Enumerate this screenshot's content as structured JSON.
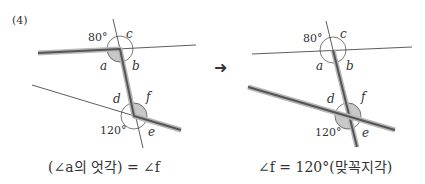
{
  "problem_number": "(4)",
  "arrow": "➜",
  "left_diagram": {
    "angle_80": "80°",
    "angle_120": "120°",
    "labels": {
      "a": "a",
      "b": "b",
      "c": "c",
      "d": "d",
      "e": "e",
      "f": "f"
    },
    "caption": "(∠a의 엇각) = ∠f"
  },
  "right_diagram": {
    "angle_80": "80°",
    "angle_120": "120°",
    "labels": {
      "a": "a",
      "b": "b",
      "c": "c",
      "d": "d",
      "e": "e",
      "f": "f"
    },
    "caption": "∠f = 120°(맞꼭지각)"
  },
  "colors": {
    "thin_line": "#333333",
    "thick_line": "#555555",
    "thick_halo": "#b8b8b8",
    "shade": "#c8c8c8"
  }
}
